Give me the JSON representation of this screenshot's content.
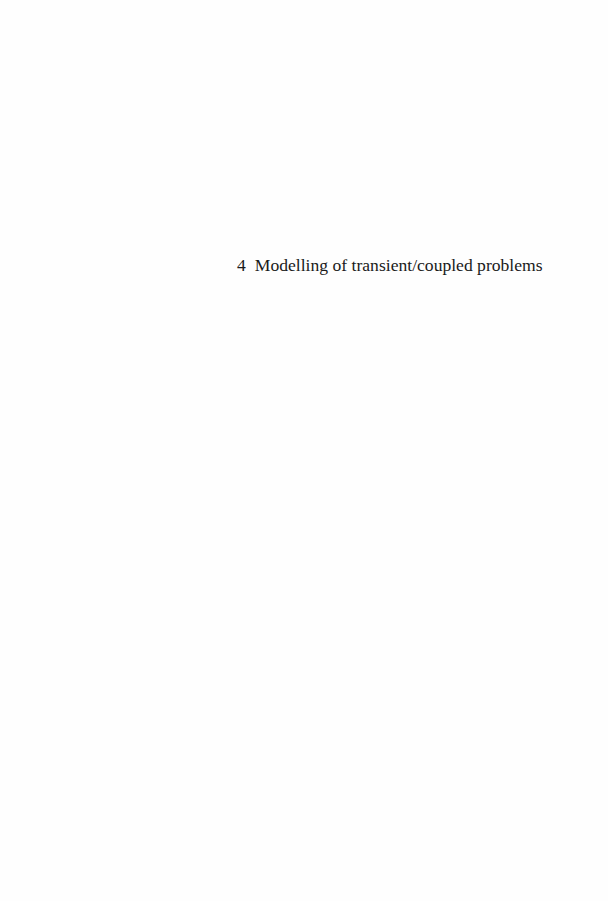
{
  "page": {
    "chapter_number": "4",
    "chapter_title": "Modelling of transient/coupled problems",
    "colors": {
      "background": "#fefefe",
      "text": "#1a1a1a"
    }
  }
}
